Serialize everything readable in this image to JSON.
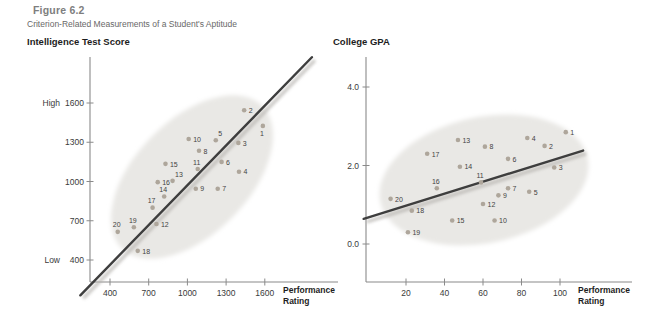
{
  "figure": {
    "label": "Figure 6.2",
    "caption": "Criterion-Related Measurements of a Student's Aptitude"
  },
  "colors": {
    "dot": "#aea69b",
    "trend_line": "#3e3e3e",
    "trend_shadow": "#b5b2ae",
    "ellipse_fill": "#e9e8e5",
    "axis": "#8a8a8a",
    "tick_text": "#3a3a3a",
    "point_label": "#434343",
    "figure_label": "#7e7e7e",
    "caption_text": "#686868",
    "title_text": "#1d1d1d"
  },
  "chart_data": [
    {
      "type": "scatter",
      "title": "Intelligence Test Score",
      "ylabel": "Intelligence Test Score",
      "xlabel": "Performance Rating",
      "grid": false,
      "legend": false,
      "envelope": true,
      "xlim": [
        245,
        2165
      ],
      "ylim": [
        230,
        1950
      ],
      "x_ticks": [
        400,
        700,
        1000,
        1300,
        1600
      ],
      "y_ticks": [
        400,
        700,
        1000,
        1300,
        1600
      ],
      "y_axis_annotations": [
        {
          "text": "High",
          "at": 1600
        },
        {
          "text": "Low",
          "at": 400
        }
      ],
      "trend_line": {
        "x1": 170,
        "y1": 130,
        "x2": 1965,
        "y2": 1950
      },
      "points": [
        {
          "id": 1,
          "x": 1585,
          "y": 1425,
          "label_pos": "b"
        },
        {
          "id": 2,
          "x": 1440,
          "y": 1545,
          "label_pos": "r"
        },
        {
          "id": 3,
          "x": 1395,
          "y": 1295,
          "label_pos": "r"
        },
        {
          "id": 4,
          "x": 1400,
          "y": 1075,
          "label_pos": "r"
        },
        {
          "id": 5,
          "x": 1220,
          "y": 1315,
          "label_pos": "ar"
        },
        {
          "id": 6,
          "x": 1265,
          "y": 1150,
          "label_pos": "r"
        },
        {
          "id": 7,
          "x": 1235,
          "y": 945,
          "label_pos": "r"
        },
        {
          "id": 8,
          "x": 1090,
          "y": 1235,
          "label_pos": "r"
        },
        {
          "id": 9,
          "x": 1065,
          "y": 945,
          "label_pos": "r"
        },
        {
          "id": 10,
          "x": 1010,
          "y": 1325,
          "label_pos": "r"
        },
        {
          "id": 11,
          "x": 1080,
          "y": 1095,
          "label_pos": "a"
        },
        {
          "id": 12,
          "x": 760,
          "y": 675,
          "label_pos": "r"
        },
        {
          "id": 13,
          "x": 885,
          "y": 1005,
          "label_pos": "ar"
        },
        {
          "id": 14,
          "x": 820,
          "y": 885,
          "label_pos": "a"
        },
        {
          "id": 15,
          "x": 830,
          "y": 1135,
          "label_pos": "r"
        },
        {
          "id": 16,
          "x": 770,
          "y": 995,
          "label_pos": "r"
        },
        {
          "id": 17,
          "x": 730,
          "y": 800,
          "label_pos": "a"
        },
        {
          "id": 18,
          "x": 615,
          "y": 470,
          "label_pos": "r"
        },
        {
          "id": 19,
          "x": 585,
          "y": 650,
          "label_pos": "a"
        },
        {
          "id": 20,
          "x": 460,
          "y": 615,
          "label_pos": "a"
        }
      ]
    },
    {
      "type": "scatter",
      "title": "College GPA",
      "ylabel": "College GPA",
      "xlabel": "Performance Rating",
      "grid": false,
      "legend": false,
      "envelope": true,
      "xlim": [
        0,
        137
      ],
      "ylim": [
        -1.0,
        4.8
      ],
      "x_ticks": [
        20,
        40,
        60,
        80,
        100
      ],
      "y_ticks": [
        0.0,
        2.0,
        4.0
      ],
      "y_axis_annotations": [],
      "trend_line": {
        "x1": -2,
        "y1": 0.64,
        "x2": 112,
        "y2": 2.38
      },
      "points": [
        {
          "id": 1,
          "x": 103,
          "y": 2.85,
          "label_pos": "r"
        },
        {
          "id": 2,
          "x": 92,
          "y": 2.5,
          "label_pos": "r"
        },
        {
          "id": 3,
          "x": 97,
          "y": 1.95,
          "label_pos": "r"
        },
        {
          "id": 4,
          "x": 83,
          "y": 2.7,
          "label_pos": "r"
        },
        {
          "id": 5,
          "x": 84,
          "y": 1.33,
          "label_pos": "r"
        },
        {
          "id": 6,
          "x": 73,
          "y": 2.17,
          "label_pos": "r"
        },
        {
          "id": 7,
          "x": 73,
          "y": 1.42,
          "label_pos": "r"
        },
        {
          "id": 8,
          "x": 61,
          "y": 2.48,
          "label_pos": "r"
        },
        {
          "id": 9,
          "x": 68,
          "y": 1.24,
          "label_pos": "r"
        },
        {
          "id": 10,
          "x": 66,
          "y": 0.6,
          "label_pos": "r"
        },
        {
          "id": 11,
          "x": 59,
          "y": 1.57,
          "label_pos": "a"
        },
        {
          "id": 12,
          "x": 60,
          "y": 1.02,
          "label_pos": "r"
        },
        {
          "id": 13,
          "x": 47,
          "y": 2.65,
          "label_pos": "r"
        },
        {
          "id": 14,
          "x": 48,
          "y": 1.97,
          "label_pos": "r"
        },
        {
          "id": 15,
          "x": 44,
          "y": 0.6,
          "label_pos": "r"
        },
        {
          "id": 16,
          "x": 36,
          "y": 1.42,
          "label_pos": "a"
        },
        {
          "id": 17,
          "x": 31,
          "y": 2.3,
          "label_pos": "r"
        },
        {
          "id": 18,
          "x": 23,
          "y": 0.85,
          "label_pos": "r"
        },
        {
          "id": 19,
          "x": 21,
          "y": 0.3,
          "label_pos": "r"
        },
        {
          "id": 20,
          "x": 12,
          "y": 1.15,
          "label_pos": "r"
        }
      ]
    }
  ]
}
